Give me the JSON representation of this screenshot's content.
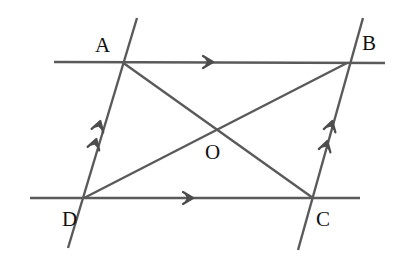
{
  "figure": {
    "canvas": {
      "width": 405,
      "height": 262
    },
    "colors": {
      "background": "#ffffff",
      "stroke": "#5a5a5a",
      "stroke_dark": "#4d4d4d",
      "label": "#111111"
    },
    "stroke_width": 2.4
  },
  "labels": [
    {
      "name": "A",
      "text": "A",
      "x": 95,
      "y": 52
    },
    {
      "name": "B",
      "text": "B",
      "x": 362,
      "y": 50
    },
    {
      "name": "C",
      "text": "C",
      "x": 316,
      "y": 226
    },
    {
      "name": "D",
      "text": "D",
      "x": 62,
      "y": 226
    },
    {
      "name": "O",
      "text": "O",
      "x": 205,
      "y": 159
    }
  ],
  "points": {
    "A": {
      "x": 122,
      "y": 62
    },
    "B": {
      "x": 347,
      "y": 63
    },
    "C": {
      "x": 313,
      "y": 198
    },
    "D": {
      "x": 84,
      "y": 198
    },
    "O": {
      "x": 215,
      "y": 128
    }
  },
  "lines": [
    {
      "name": "top-parallel-line",
      "role": "line through A and B",
      "x1": 54,
      "y1": 62,
      "x2": 385,
      "y2": 63,
      "arrow_marks": 1
    },
    {
      "name": "bottom-parallel-line",
      "role": "line through D and C",
      "x1": 30,
      "y1": 198,
      "x2": 360,
      "y2": 198,
      "arrow_marks": 1
    },
    {
      "name": "left-transversal-line",
      "role": "line through D and A",
      "x1": 137,
      "y1": 18,
      "x2": 68,
      "y2": 248,
      "arrow_marks": 2
    },
    {
      "name": "right-transversal-line",
      "role": "line through C and B",
      "x1": 363,
      "y1": 18,
      "x2": 298,
      "y2": 250,
      "arrow_marks": 2
    },
    {
      "name": "diagonal-ac",
      "role": "diagonal from A to C",
      "x1": 122,
      "y1": 62,
      "x2": 313,
      "y2": 198,
      "arrow_marks": 0
    },
    {
      "name": "diagonal-db",
      "role": "diagonal from D to B",
      "x1": 84,
      "y1": 198,
      "x2": 347,
      "y2": 63,
      "arrow_marks": 0
    }
  ],
  "arrows": [
    {
      "name": "top-line-arrow",
      "x": 212,
      "y": 62,
      "angle": 0
    },
    {
      "name": "bottom-line-arrow",
      "x": 192,
      "y": 198,
      "angle": 0
    },
    {
      "name": "left-line-arrow-1",
      "x": 100,
      "y": 122,
      "angle": -73.3
    },
    {
      "name": "left-line-arrow-2",
      "x": 96,
      "y": 140,
      "angle": -73.3
    },
    {
      "name": "right-line-arrow-1",
      "x": 332,
      "y": 122,
      "angle": -74.4
    },
    {
      "name": "right-line-arrow-2",
      "x": 327,
      "y": 142,
      "angle": -74.4
    }
  ]
}
